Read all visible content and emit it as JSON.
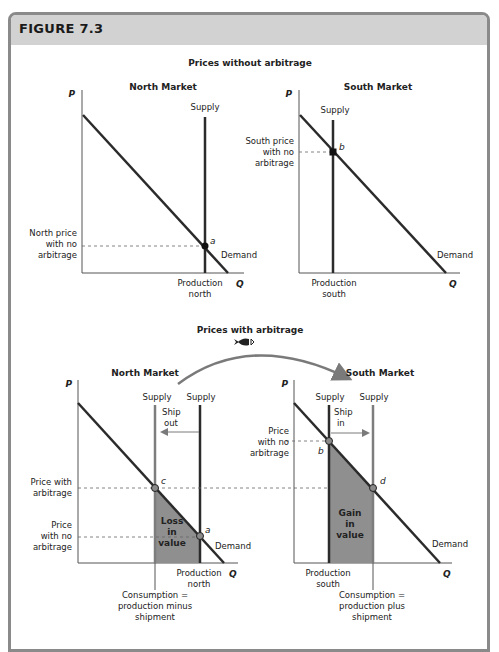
{
  "figure": {
    "title": "FIGURE 7.3",
    "header_color": "#d2d2d2",
    "frame_color": "#8a8a8a"
  },
  "top": {
    "title": "Prices without arbitrage",
    "north": {
      "market_title": "North Market",
      "p_axis": "P",
      "q_axis": "Q",
      "supply_label": "Supply",
      "demand_label": "Demand",
      "point_label": "a",
      "price_label": [
        "North price",
        "with no",
        "arbitrage"
      ],
      "production_label": [
        "Production",
        "north"
      ]
    },
    "south": {
      "market_title": "South Market",
      "p_axis": "P",
      "q_axis": "Q",
      "supply_label": "Supply",
      "demand_label": "Demand",
      "point_label": "b",
      "price_label": [
        "South price",
        "with no",
        "arbitrage"
      ],
      "production_label": [
        "Production",
        "south"
      ]
    }
  },
  "bottom": {
    "title": "Prices with arbitrage",
    "icon": "fish-icon",
    "north": {
      "market_title": "North Market",
      "p_axis": "P",
      "q_axis": "Q",
      "supply_left_label": "Supply",
      "supply_right_label": "Supply",
      "ship_label": [
        "Ship",
        "out"
      ],
      "demand_label": "Demand",
      "point_c": "c",
      "point_a": "a",
      "price_with_label": [
        "Price with",
        "arbitrage"
      ],
      "price_without_label": [
        "Price",
        "with no",
        "arbitrage"
      ],
      "area_label": [
        "Loss",
        "in",
        "value"
      ],
      "production_label": [
        "Production",
        "north"
      ],
      "consumption_label": [
        "Consumption =",
        "production minus",
        "shipment"
      ]
    },
    "south": {
      "market_title": "South Market",
      "p_axis": "P",
      "q_axis": "Q",
      "supply_left_label": "Supply",
      "supply_right_label": "Supply",
      "ship_label": [
        "Ship",
        "in"
      ],
      "demand_label": "Demand",
      "point_b": "b",
      "point_d": "d",
      "price_without_label": [
        "Price",
        "with no",
        "arbitrage"
      ],
      "area_label": [
        "Gain",
        "in",
        "value"
      ],
      "production_label": [
        "Production",
        "south"
      ],
      "consumption_label": [
        "Consumption =",
        "production plus",
        "shipment"
      ]
    }
  },
  "colors": {
    "line_dark": "#2b2b2b",
    "line_gray": "#7d7d7d",
    "fill_gray": "#8f8f8f",
    "point_fill": "#8a8a8a",
    "point_black": "#111111",
    "dashed": "#666666",
    "arrow": "#7a7a7a"
  }
}
